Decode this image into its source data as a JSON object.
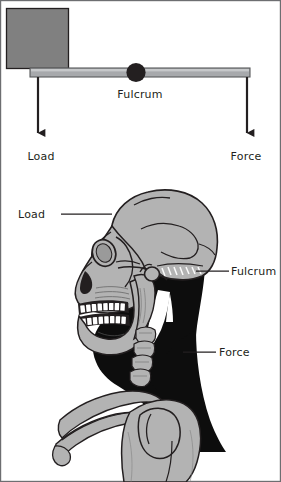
{
  "figure": {
    "border_color": "#6d6e71",
    "background_color": "#ffffff",
    "ink_color": "#231f20"
  },
  "colors": {
    "block_gray": "#808080",
    "block_outline": "#231f20",
    "bar_gray": "#a7a9ac",
    "bar_outline": "#58595b",
    "fulcrum_dark": "#231f20",
    "bone_light": "#b3b3b3",
    "bone_mid": "#9a9a9a",
    "muscle_black": "#0d0d0d",
    "outline": "#231f20",
    "white": "#ffffff"
  },
  "lever_diagram": {
    "name": "schematic-lever",
    "block": {
      "label": "",
      "x": 6,
      "y": 8,
      "width": 63,
      "height": 61
    },
    "bar": {
      "x": 30,
      "y": 68,
      "width": 220,
      "height": 9
    },
    "fulcrum": {
      "cx": 136,
      "cy": 72,
      "r": 9.5
    },
    "labels": {
      "fulcrum": "Fulcrum",
      "load": "Load",
      "force": "Force"
    },
    "arrows": [
      {
        "name": "load-arrow",
        "label": "Load",
        "x": 38,
        "y_start": 77,
        "y_end": 140,
        "direction": "down"
      },
      {
        "name": "force-arrow",
        "label": "Force",
        "x": 247,
        "y_start": 77,
        "y_end": 140,
        "direction": "down"
      }
    ]
  },
  "anatomy_diagram": {
    "name": "skull-neck-lever",
    "labels": {
      "load": "Load",
      "fulcrum": "Fulcrum",
      "force": "Force"
    },
    "callouts": [
      {
        "name": "callout-load",
        "label": "Load",
        "text_x": 18,
        "text_y": 217,
        "line_x1": 61,
        "line_x2": 97,
        "line_y": 214
      },
      {
        "name": "callout-fulcrum",
        "label": "Fulcrum",
        "text_x": 231,
        "text_y": 276,
        "line_x1": 199,
        "line_x2": 227,
        "line_y": 272
      },
      {
        "name": "callout-force",
        "label": "Force",
        "text_x": 219,
        "text_y": 357,
        "line_x1": 183,
        "line_x2": 215,
        "line_y": 353
      }
    ]
  }
}
